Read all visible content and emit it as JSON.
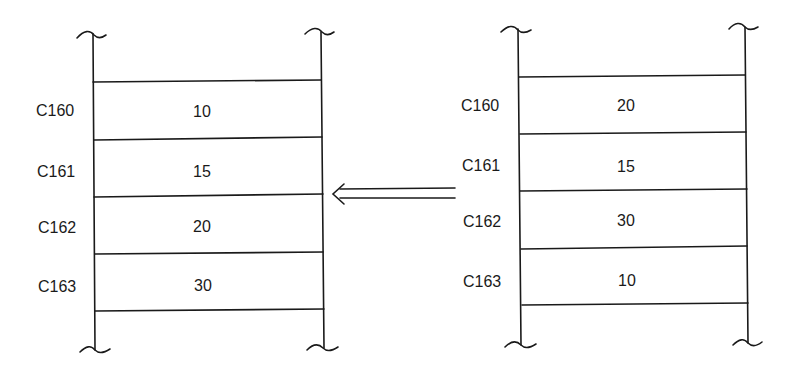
{
  "diagram": {
    "type": "memory-block-comparison",
    "arrow": {
      "direction": "right-to-left",
      "style": "double-line"
    },
    "left_block": {
      "cells": [
        {
          "address": "C160",
          "value": "10"
        },
        {
          "address": "C161",
          "value": "15"
        },
        {
          "address": "C162",
          "value": "20"
        },
        {
          "address": "C163",
          "value": "30"
        }
      ]
    },
    "right_block": {
      "cells": [
        {
          "address": "C160",
          "value": "20"
        },
        {
          "address": "C161",
          "value": "15"
        },
        {
          "address": "C162",
          "value": "30"
        },
        {
          "address": "C163",
          "value": "10"
        }
      ]
    },
    "colors": {
      "line": "#1a1a1a",
      "background": "#ffffff"
    }
  }
}
